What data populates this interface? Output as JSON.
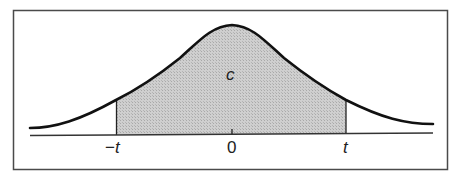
{
  "figure": {
    "type": "normal-distribution-central-area",
    "labels": {
      "area": "c",
      "left_bound": "−t",
      "center": "0",
      "right_bound": "t"
    },
    "colors": {
      "frame": "#4a4a4a",
      "curve": "#111111",
      "shade": "#c8c8c8",
      "axis": "#333333",
      "background": "#ffffff"
    }
  },
  "chart_data": {
    "type": "area",
    "title": "",
    "xlabel": "",
    "ylabel": "",
    "curve": "standard normal density",
    "shaded_interval": [
      "-t",
      "t"
    ],
    "shaded_area_label": "c",
    "x_ticks": [
      "-t",
      "0",
      "t"
    ],
    "grid": false,
    "legend": false
  }
}
